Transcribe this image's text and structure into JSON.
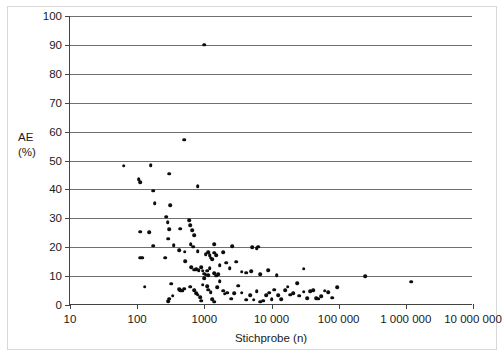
{
  "chart_data": {
    "type": "scatter",
    "title": "",
    "xlabel": "Stichprobe (n)",
    "ylabel_line1": "AE",
    "ylabel_line2": "(%)",
    "xscale": "log",
    "yscale": "linear",
    "xlim": [
      10,
      10000000
    ],
    "ylim": [
      0,
      100
    ],
    "grid": "horizontal",
    "legend": "none",
    "xticks": [
      10,
      100,
      1000,
      10000,
      100000,
      1000000,
      10000000
    ],
    "xticklabels": [
      "10",
      "100",
      "1000",
      "10 000",
      "100 000",
      "1 000 000",
      "10 000 000"
    ],
    "yticks": [
      0,
      10,
      20,
      30,
      40,
      50,
      60,
      70,
      80,
      90,
      100
    ],
    "yticklabels": [
      "0",
      "10",
      "20",
      "30",
      "40",
      "50",
      "60",
      "70",
      "80",
      "90",
      "100"
    ],
    "marker": "filled-circle",
    "marker_color": "#0d0d0d",
    "series": [
      {
        "name": "studies",
        "points": [
          [
            63,
            48.2
          ],
          [
            105,
            43.6
          ],
          [
            110,
            42.5
          ],
          [
            160,
            48.4
          ],
          [
            175,
            39.6
          ],
          [
            182,
            35.3
          ],
          [
            300,
            45.5
          ],
          [
            310,
            34.5
          ],
          [
            500,
            57.2
          ],
          [
            800,
            41.2
          ],
          [
            1000,
            90.0
          ],
          [
            110,
            25.3
          ],
          [
            150,
            25.2
          ],
          [
            270,
            30.6
          ],
          [
            285,
            28.6
          ],
          [
            300,
            26.2
          ],
          [
            440,
            26.4
          ],
          [
            600,
            29.4
          ],
          [
            620,
            27.7
          ],
          [
            660,
            25.8
          ],
          [
            700,
            24.1
          ],
          [
            290,
            23.0
          ],
          [
            350,
            20.6
          ],
          [
            175,
            20.5
          ],
          [
            630,
            21.1
          ],
          [
            800,
            18.6
          ],
          [
            1400,
            21.0
          ],
          [
            680,
            20.2
          ],
          [
            112,
            16.4
          ],
          [
            118,
            16.3
          ],
          [
            260,
            16.4
          ],
          [
            420,
            19.0
          ],
          [
            510,
            18.5
          ],
          [
            1050,
            17.6
          ],
          [
            1150,
            18.2
          ],
          [
            1200,
            17.2
          ],
          [
            1250,
            16.4
          ],
          [
            1300,
            15.8
          ],
          [
            1400,
            18.1
          ],
          [
            1500,
            17.3
          ],
          [
            1900,
            18.3
          ],
          [
            2600,
            20.3
          ],
          [
            5200,
            19.9
          ],
          [
            6000,
            19.6
          ],
          [
            6400,
            20.2
          ],
          [
            520,
            15.1
          ],
          [
            640,
            13.0
          ],
          [
            700,
            12.2
          ],
          [
            760,
            12.4
          ],
          [
            820,
            12.0
          ],
          [
            900,
            13.1
          ],
          [
            950,
            11.8
          ],
          [
            1000,
            10.8
          ],
          [
            1050,
            10.5
          ],
          [
            1100,
            11.9
          ],
          [
            1150,
            10.3
          ],
          [
            1200,
            12.7
          ],
          [
            1400,
            11.0
          ],
          [
            1500,
            10.2
          ],
          [
            1600,
            10.7
          ],
          [
            1700,
            13.8
          ],
          [
            2100,
            14.7
          ],
          [
            2400,
            12.8
          ],
          [
            3000,
            15.0
          ],
          [
            3600,
            11.5
          ],
          [
            4200,
            11.2
          ],
          [
            5000,
            11.6
          ],
          [
            6800,
            10.7
          ],
          [
            9000,
            12.0
          ],
          [
            12000,
            10.3
          ],
          [
            30000,
            12.5
          ],
          [
            250000,
            10.0
          ],
          [
            1200000,
            8.1
          ],
          [
            130,
            6.3
          ],
          [
            320,
            7.3
          ],
          [
            420,
            5.4
          ],
          [
            440,
            5.2
          ],
          [
            470,
            4.9
          ],
          [
            500,
            5.6
          ],
          [
            300,
            2.2
          ],
          [
            340,
            3.2
          ],
          [
            290,
            1.3
          ],
          [
            620,
            6.4
          ],
          [
            700,
            5.1
          ],
          [
            760,
            4.1
          ],
          [
            800,
            3.5
          ],
          [
            860,
            2.6
          ],
          [
            900,
            1.5
          ],
          [
            950,
            7.0
          ],
          [
            1000,
            9.3
          ],
          [
            1100,
            6.5
          ],
          [
            1150,
            5.3
          ],
          [
            1250,
            4.4
          ],
          [
            1300,
            2.1
          ],
          [
            1400,
            1.2
          ],
          [
            1550,
            6.2
          ],
          [
            1700,
            8.2
          ],
          [
            1900,
            5.0
          ],
          [
            2000,
            3.9
          ],
          [
            2200,
            4.3
          ],
          [
            2500,
            2.2
          ],
          [
            2800,
            4.0
          ],
          [
            3200,
            6.7
          ],
          [
            3600,
            4.2
          ],
          [
            4200,
            1.9
          ],
          [
            4800,
            3.4
          ],
          [
            5400,
            1.8
          ],
          [
            6000,
            4.7
          ],
          [
            6800,
            1.1
          ],
          [
            7600,
            1.5
          ],
          [
            8400,
            3.4
          ],
          [
            9200,
            4.2
          ],
          [
            10000,
            2.0
          ],
          [
            11000,
            5.3
          ],
          [
            12500,
            3.4
          ],
          [
            14000,
            2.1
          ],
          [
            16000,
            5.2
          ],
          [
            17500,
            6.3
          ],
          [
            19000,
            3.6
          ],
          [
            21000,
            4.1
          ],
          [
            24000,
            7.5
          ],
          [
            26000,
            3.2
          ],
          [
            30000,
            4.6
          ],
          [
            34000,
            2.3
          ],
          [
            38000,
            4.8
          ],
          [
            42000,
            5.1
          ],
          [
            46000,
            2.4
          ],
          [
            50000,
            2.2
          ],
          [
            55000,
            3.0
          ],
          [
            62000,
            5.0
          ],
          [
            70000,
            4.4
          ],
          [
            80000,
            2.5
          ],
          [
            95000,
            6.1
          ]
        ]
      }
    ]
  }
}
